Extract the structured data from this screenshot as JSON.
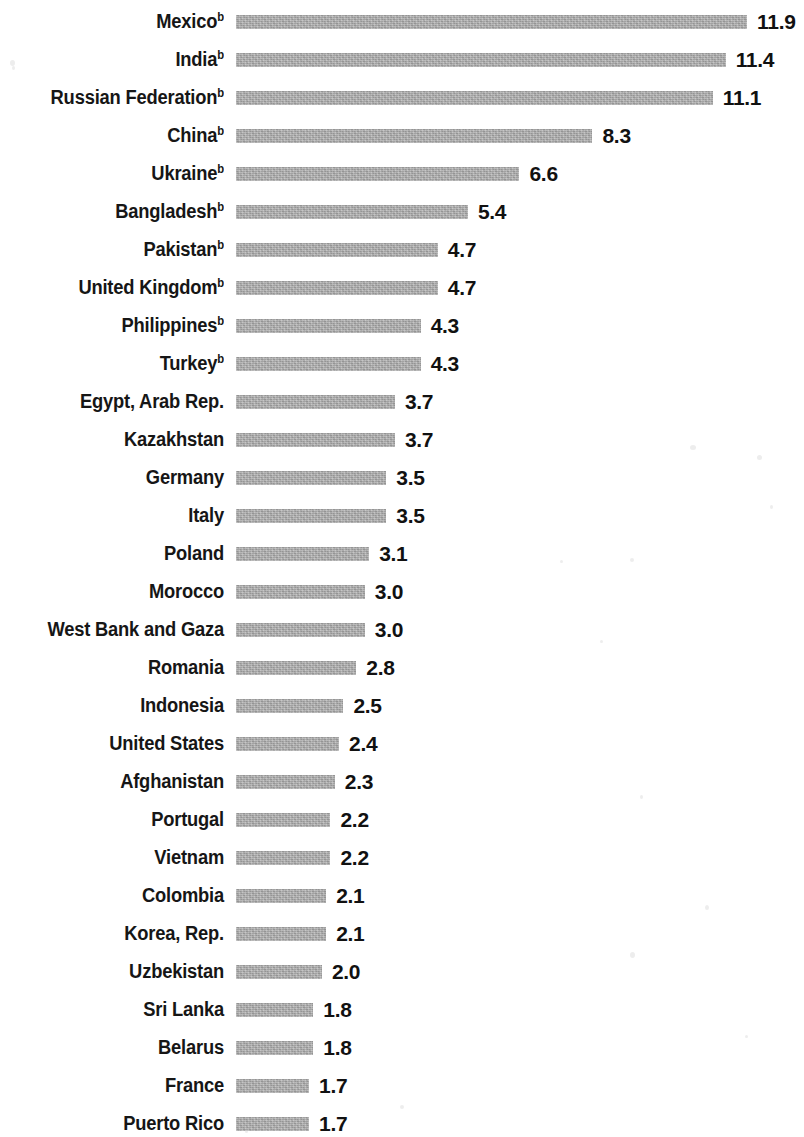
{
  "chart_data": {
    "type": "bar",
    "orientation": "horizontal",
    "title": "",
    "subtitle": "",
    "xlabel": "",
    "ylabel": "",
    "grid": false,
    "legend": null,
    "axis_visible": false,
    "xlim": [
      0,
      11.9
    ],
    "value_format": "one-decimal",
    "footnote_marker": "b",
    "bar_color": "#a9a9a9",
    "text_color": "#111111",
    "background_color": "#ffffff",
    "categories": [
      "Mexico",
      "India",
      "Russian Federation",
      "China",
      "Ukraine",
      "Bangladesh",
      "Pakistan",
      "United Kingdom",
      "Philippines",
      "Turkey",
      "Egypt, Arab Rep.",
      "Kazakhstan",
      "Germany",
      "Italy",
      "Poland",
      "Morocco",
      "West Bank and Gaza",
      "Romania",
      "Indonesia",
      "United States",
      "Afghanistan",
      "Portugal",
      "Vietnam",
      "Colombia",
      "Korea, Rep.",
      "Uzbekistan",
      "Sri Lanka",
      "Belarus",
      "France",
      "Puerto Rico"
    ],
    "values": [
      11.9,
      11.4,
      11.1,
      8.3,
      6.6,
      5.4,
      4.7,
      4.7,
      4.3,
      4.3,
      3.7,
      3.7,
      3.5,
      3.5,
      3.1,
      3.0,
      3.0,
      2.8,
      2.5,
      2.4,
      2.3,
      2.2,
      2.2,
      2.1,
      2.1,
      2.0,
      1.8,
      1.8,
      1.7,
      1.7
    ],
    "rows": [
      {
        "label": "Mexico",
        "marker": "b",
        "value": 11.9,
        "value_text": "11.9"
      },
      {
        "label": "India",
        "marker": "b",
        "value": 11.4,
        "value_text": "11.4"
      },
      {
        "label": "Russian Federation",
        "marker": "b",
        "value": 11.1,
        "value_text": "11.1"
      },
      {
        "label": "China",
        "marker": "b",
        "value": 8.3,
        "value_text": "8.3"
      },
      {
        "label": "Ukraine",
        "marker": "b",
        "value": 6.6,
        "value_text": "6.6"
      },
      {
        "label": "Bangladesh",
        "marker": "b",
        "value": 5.4,
        "value_text": "5.4"
      },
      {
        "label": "Pakistan",
        "marker": "b",
        "value": 4.7,
        "value_text": "4.7"
      },
      {
        "label": "United Kingdom",
        "marker": "b",
        "value": 4.7,
        "value_text": "4.7"
      },
      {
        "label": "Philippines",
        "marker": "b",
        "value": 4.3,
        "value_text": "4.3"
      },
      {
        "label": "Turkey",
        "marker": "b",
        "value": 4.3,
        "value_text": "4.3"
      },
      {
        "label": "Egypt, Arab Rep.",
        "marker": "",
        "value": 3.7,
        "value_text": "3.7"
      },
      {
        "label": "Kazakhstan",
        "marker": "",
        "value": 3.7,
        "value_text": "3.7"
      },
      {
        "label": "Germany",
        "marker": "",
        "value": 3.5,
        "value_text": "3.5"
      },
      {
        "label": "Italy",
        "marker": "",
        "value": 3.5,
        "value_text": "3.5"
      },
      {
        "label": "Poland",
        "marker": "",
        "value": 3.1,
        "value_text": "3.1"
      },
      {
        "label": "Morocco",
        "marker": "",
        "value": 3.0,
        "value_text": "3.0"
      },
      {
        "label": "West Bank and Gaza",
        "marker": "",
        "value": 3.0,
        "value_text": "3.0"
      },
      {
        "label": "Romania",
        "marker": "",
        "value": 2.8,
        "value_text": "2.8"
      },
      {
        "label": "Indonesia",
        "marker": "",
        "value": 2.5,
        "value_text": "2.5"
      },
      {
        "label": "United States",
        "marker": "",
        "value": 2.4,
        "value_text": "2.4"
      },
      {
        "label": "Afghanistan",
        "marker": "",
        "value": 2.3,
        "value_text": "2.3"
      },
      {
        "label": "Portugal",
        "marker": "",
        "value": 2.2,
        "value_text": "2.2"
      },
      {
        "label": "Vietnam",
        "marker": "",
        "value": 2.2,
        "value_text": "2.2"
      },
      {
        "label": "Colombia",
        "marker": "",
        "value": 2.1,
        "value_text": "2.1"
      },
      {
        "label": "Korea, Rep.",
        "marker": "",
        "value": 2.1,
        "value_text": "2.1"
      },
      {
        "label": "Uzbekistan",
        "marker": "",
        "value": 2.0,
        "value_text": "2.0"
      },
      {
        "label": "Sri Lanka",
        "marker": "",
        "value": 1.8,
        "value_text": "1.8"
      },
      {
        "label": "Belarus",
        "marker": "",
        "value": 1.8,
        "value_text": "1.8"
      },
      {
        "label": "France",
        "marker": "",
        "value": 1.7,
        "value_text": "1.7"
      },
      {
        "label": "Puerto Rico",
        "marker": "",
        "value": 1.7,
        "value_text": "1.7"
      }
    ]
  }
}
